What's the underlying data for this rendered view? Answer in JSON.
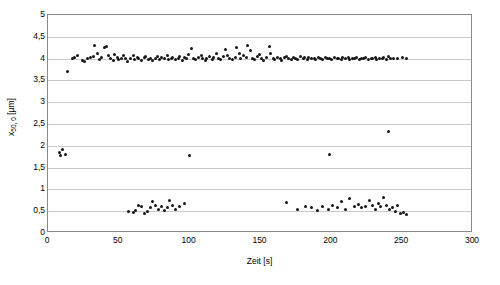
{
  "chart_data": {
    "type": "scatter",
    "title": "",
    "xlabel": "Zeit [s]",
    "ylabel": "x50,0 [µm]",
    "ylabel_base": "x",
    "ylabel_sub": "50, 0",
    "ylabel_unit": " [µm]",
    "xlim": [
      0,
      300
    ],
    "ylim": [
      0,
      5
    ],
    "xticks": [
      0,
      50,
      100,
      150,
      200,
      250,
      300
    ],
    "xticklabels": [
      "0",
      "50",
      "100",
      "150",
      "200",
      "250",
      "300"
    ],
    "yticks": [
      0,
      0.5,
      1,
      1.5,
      2,
      2.5,
      3,
      3.5,
      4,
      4.5,
      5
    ],
    "yticklabels": [
      "0",
      "0,5",
      "1",
      "1,5",
      "2",
      "2,5",
      "3",
      "3,5",
      "4",
      "4,5",
      "5"
    ],
    "grid": "horizontal",
    "legend": "none",
    "marker": "filled-circle",
    "marker_color": "#161616",
    "series": [
      {
        "name": "x50,0",
        "points": [
          [
            8,
            1.84
          ],
          [
            9,
            1.78
          ],
          [
            10,
            1.92
          ],
          [
            12,
            1.8
          ],
          [
            14,
            3.7
          ],
          [
            17,
            4.0
          ],
          [
            19,
            4.03
          ],
          [
            21,
            4.07
          ],
          [
            24,
            3.95
          ],
          [
            26,
            3.93
          ],
          [
            28,
            4.0
          ],
          [
            30,
            4.02
          ],
          [
            32,
            4.05
          ],
          [
            33,
            4.3
          ],
          [
            35,
            4.12
          ],
          [
            36,
            3.98
          ],
          [
            38,
            4.02
          ],
          [
            40,
            4.25
          ],
          [
            41,
            4.28
          ],
          [
            43,
            4.08
          ],
          [
            44,
            4.0
          ],
          [
            46,
            3.96
          ],
          [
            47,
            4.1
          ],
          [
            49,
            4.03
          ],
          [
            50,
            3.97
          ],
          [
            52,
            4.0
          ],
          [
            53,
            4.06
          ],
          [
            55,
            4.0
          ],
          [
            56,
            3.93
          ],
          [
            58,
            4.01
          ],
          [
            60,
            4.08
          ],
          [
            61,
            3.98
          ],
          [
            63,
            4.03
          ],
          [
            64,
            4.0
          ],
          [
            66,
            3.96
          ],
          [
            68,
            4.02
          ],
          [
            69,
            4.05
          ],
          [
            71,
            3.99
          ],
          [
            72,
            4.01
          ],
          [
            74,
            3.95
          ],
          [
            76,
            4.0
          ],
          [
            77,
            4.04
          ],
          [
            79,
            3.98
          ],
          [
            80,
            4.02
          ],
          [
            82,
            4.0
          ],
          [
            84,
            4.06
          ],
          [
            85,
            3.97
          ],
          [
            87,
            4.01
          ],
          [
            88,
            4.03
          ],
          [
            90,
            3.99
          ],
          [
            92,
            4.0
          ],
          [
            93,
            4.05
          ],
          [
            95,
            3.96
          ],
          [
            96,
            4.02
          ],
          [
            98,
            4.0
          ],
          [
            99,
            4.1
          ],
          [
            101,
            4.24
          ],
          [
            103,
            4.0
          ],
          [
            104,
            3.98
          ],
          [
            106,
            4.03
          ],
          [
            108,
            4.07
          ],
          [
            109,
            4.0
          ],
          [
            111,
            3.95
          ],
          [
            112,
            4.01
          ],
          [
            114,
            4.04
          ],
          [
            116,
            3.99
          ],
          [
            117,
            4.02
          ],
          [
            119,
            4.12
          ],
          [
            120,
            4.0
          ],
          [
            122,
            3.97
          ],
          [
            124,
            4.05
          ],
          [
            125,
            4.2
          ],
          [
            127,
            4.08
          ],
          [
            128,
            4.01
          ],
          [
            130,
            3.98
          ],
          [
            132,
            4.03
          ],
          [
            133,
            4.25
          ],
          [
            135,
            4.12
          ],
          [
            136,
            4.0
          ],
          [
            138,
            4.06
          ],
          [
            140,
            4.02
          ],
          [
            141,
            4.3
          ],
          [
            143,
            4.18
          ],
          [
            144,
            4.0
          ],
          [
            146,
            3.97
          ],
          [
            148,
            4.04
          ],
          [
            149,
            4.09
          ],
          [
            151,
            4.0
          ],
          [
            152,
            3.95
          ],
          [
            154,
            4.02
          ],
          [
            156,
            4.28
          ],
          [
            157,
            4.12
          ],
          [
            159,
            4.0
          ],
          [
            160,
            3.98
          ],
          [
            162,
            4.03
          ],
          [
            164,
            4.0
          ],
          [
            165,
            3.96
          ],
          [
            167,
            4.02
          ],
          [
            168,
            4.05
          ],
          [
            170,
            4.0
          ],
          [
            172,
            3.99
          ],
          [
            173,
            4.03
          ],
          [
            175,
            4.01
          ],
          [
            176,
            3.97
          ],
          [
            178,
            4.04
          ],
          [
            180,
            4.0
          ],
          [
            181,
            4.02
          ],
          [
            183,
            3.98
          ],
          [
            184,
            4.03
          ],
          [
            186,
            4.0
          ],
          [
            188,
            4.01
          ],
          [
            189,
            3.99
          ],
          [
            191,
            4.02
          ],
          [
            192,
            4.0
          ],
          [
            194,
            3.98
          ],
          [
            196,
            4.03
          ],
          [
            197,
            4.01
          ],
          [
            199,
            4.0
          ],
          [
            200,
            3.99
          ],
          [
            202,
            4.02
          ],
          [
            204,
            4.0
          ],
          [
            205,
            4.01
          ],
          [
            207,
            3.98
          ],
          [
            208,
            4.03
          ],
          [
            210,
            4.0
          ],
          [
            212,
            4.02
          ],
          [
            213,
            3.99
          ],
          [
            215,
            4.01
          ],
          [
            216,
            4.0
          ],
          [
            218,
            4.03
          ],
          [
            220,
            3.98
          ],
          [
            221,
            4.01
          ],
          [
            223,
            4.0
          ],
          [
            224,
            4.02
          ],
          [
            226,
            3.99
          ],
          [
            228,
            4.01
          ],
          [
            229,
            4.0
          ],
          [
            231,
            4.03
          ],
          [
            232,
            3.98
          ],
          [
            234,
            4.01
          ],
          [
            236,
            4.0
          ],
          [
            237,
            4.02
          ],
          [
            239,
            3.99
          ],
          [
            240,
            4.04
          ],
          [
            242,
            4.0
          ],
          [
            244,
            4.01
          ],
          [
            247,
            4.0
          ],
          [
            250,
            4.02
          ],
          [
            253,
            4.0
          ],
          [
            100,
            1.78
          ],
          [
            199,
            1.8
          ],
          [
            240,
            2.33
          ],
          [
            57,
            0.5
          ],
          [
            60,
            0.48
          ],
          [
            62,
            0.52
          ],
          [
            64,
            0.62
          ],
          [
            66,
            0.6
          ],
          [
            68,
            0.45
          ],
          [
            70,
            0.5
          ],
          [
            72,
            0.58
          ],
          [
            74,
            0.72
          ],
          [
            76,
            0.63
          ],
          [
            78,
            0.55
          ],
          [
            80,
            0.6
          ],
          [
            82,
            0.52
          ],
          [
            84,
            0.58
          ],
          [
            86,
            0.75
          ],
          [
            88,
            0.62
          ],
          [
            90,
            0.55
          ],
          [
            93,
            0.6
          ],
          [
            96,
            0.68
          ],
          [
            168,
            0.7
          ],
          [
            176,
            0.55
          ],
          [
            182,
            0.6
          ],
          [
            186,
            0.58
          ],
          [
            190,
            0.52
          ],
          [
            194,
            0.6
          ],
          [
            198,
            0.55
          ],
          [
            201,
            0.62
          ],
          [
            204,
            0.58
          ],
          [
            207,
            0.73
          ],
          [
            210,
            0.55
          ],
          [
            213,
            0.8
          ],
          [
            216,
            0.6
          ],
          [
            219,
            0.65
          ],
          [
            221,
            0.58
          ],
          [
            224,
            0.6
          ],
          [
            227,
            0.75
          ],
          [
            229,
            0.62
          ],
          [
            231,
            0.55
          ],
          [
            233,
            0.68
          ],
          [
            235,
            0.6
          ],
          [
            237,
            0.82
          ],
          [
            239,
            0.63
          ],
          [
            241,
            0.55
          ],
          [
            243,
            0.58
          ],
          [
            245,
            0.5
          ],
          [
            247,
            0.62
          ],
          [
            249,
            0.45
          ],
          [
            251,
            0.48
          ],
          [
            253,
            0.42
          ]
        ]
      }
    ]
  }
}
